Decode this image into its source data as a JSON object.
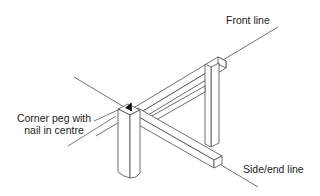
{
  "diagram": {
    "labels": {
      "front_line": "Front line",
      "corner_peg_line1": "Corner peg with",
      "corner_peg_line2": "nail in centre",
      "side_end_line": "Side/end line"
    },
    "colors": {
      "stroke": "#4a4a4a",
      "fill": "#ffffff",
      "nail": "#111111"
    }
  }
}
